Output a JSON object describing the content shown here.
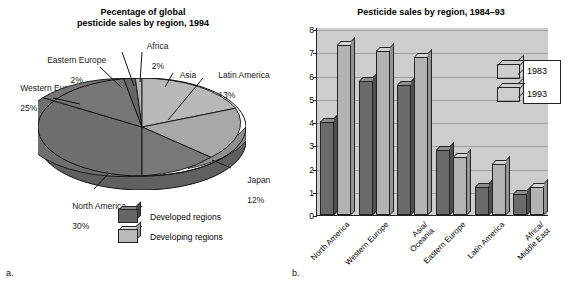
{
  "figure": {
    "panel_a_caption": "a.",
    "panel_b_caption": "b."
  },
  "pie_panel": {
    "title_line1": "Pecentage of global",
    "title_line2": "pesticide sales by region, 1994",
    "legend": [
      {
        "label": "Developed regions",
        "swatch": "dark-cube-icon",
        "color": "#666666"
      },
      {
        "label": "Developing regions",
        "swatch": "light-cube-icon",
        "color": "#b9b9b9"
      }
    ],
    "labels": [
      {
        "name": "Africa",
        "value": "2%"
      },
      {
        "name": "Eastern Europe",
        "value": "2%"
      },
      {
        "name": "Western Europe",
        "value": "25%"
      },
      {
        "name": "North America",
        "value": "30%"
      },
      {
        "name": "Japan",
        "value": "12%"
      },
      {
        "name": "Latin America",
        "value": "13%"
      },
      {
        "name": "Asia",
        "value": "16%"
      }
    ]
  },
  "bar_panel": {
    "title": "Pesticide sales by region, 1984–93",
    "legend": [
      {
        "label": "1983",
        "color": "#6a6a6a"
      },
      {
        "label": "1993",
        "color": "#b3b3b3"
      }
    ]
  },
  "chart_data": [
    {
      "type": "pie",
      "title": "Pecentage of global pesticide sales by region, 1994",
      "unit": "percent",
      "legend_position": "bottom",
      "categories": [
        "Asia",
        "Latin America",
        "Japan",
        "North America",
        "Western Europe",
        "Eastern Europe",
        "Africa"
      ],
      "values": [
        16,
        13,
        12,
        30,
        25,
        2,
        2
      ],
      "slice_groups": [
        "Developing regions",
        "Developing regions",
        "Developed regions",
        "Developed regions",
        "Developed regions",
        "Developed regions",
        "Developing regions"
      ],
      "labels": [
        "Asia 16%",
        "Latin America 13%",
        "Japan 12%",
        "North America 30%",
        "Western Europe 25%",
        "Eastern Europe 2%",
        "Africa 2%"
      ]
    },
    {
      "type": "bar",
      "title": "Pesticide sales by region, 1984–93",
      "xlabel": "",
      "ylabel": "Billion U.S. dollars",
      "ylim": [
        0,
        8
      ],
      "yticks": [
        0,
        1,
        2,
        3,
        4,
        5,
        6,
        7,
        8
      ],
      "grid": true,
      "legend_position": "upper right",
      "categories": [
        "North America",
        "Western Europe",
        "Asia/ Oceania",
        "Eastern Europe",
        "Latin America",
        "Africa/ Middle East"
      ],
      "series": [
        {
          "name": "1983",
          "values": [
            4.0,
            5.75,
            5.6,
            2.8,
            1.2,
            0.9
          ]
        },
        {
          "name": "1993",
          "values": [
            7.3,
            7.05,
            6.8,
            2.5,
            2.2,
            1.2
          ]
        }
      ]
    }
  ]
}
